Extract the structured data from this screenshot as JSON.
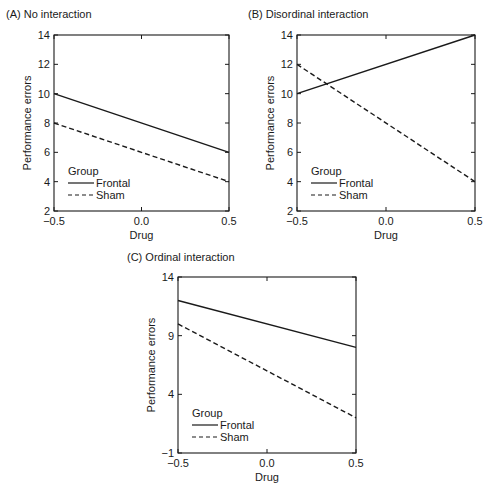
{
  "chart_data": [
    {
      "panel": "A",
      "type": "line",
      "title": "(A) No interaction",
      "xlabel": "Drug",
      "ylabel": "Performance errors",
      "x": [
        -0.5,
        0.5
      ],
      "xticks": [
        "-0.5",
        "0.0",
        "0.5"
      ],
      "xlim": [
        -0.5,
        0.5
      ],
      "yticks": [
        2,
        4,
        6,
        8,
        10,
        12,
        14
      ],
      "ylim": [
        2,
        14
      ],
      "legend_title": "Group",
      "legend_position": "lower left",
      "series": [
        {
          "name": "Frontal",
          "style": "solid",
          "values": [
            10,
            6
          ]
        },
        {
          "name": "Sham",
          "style": "dashed",
          "values": [
            8,
            4
          ]
        }
      ],
      "grid": false
    },
    {
      "panel": "B",
      "type": "line",
      "title": "(B) Disordinal interaction",
      "xlabel": "Drug",
      "ylabel": "Performance errors",
      "x": [
        -0.5,
        0.5
      ],
      "xticks": [
        "-0.5",
        "0.0",
        "0.5"
      ],
      "xlim": [
        -0.5,
        0.5
      ],
      "yticks": [
        2,
        4,
        6,
        8,
        10,
        12,
        14
      ],
      "ylim": [
        2,
        14
      ],
      "legend_title": "Group",
      "legend_position": "lower left",
      "series": [
        {
          "name": "Frontal",
          "style": "solid",
          "values": [
            10,
            14
          ]
        },
        {
          "name": "Sham",
          "style": "dashed",
          "values": [
            12,
            4
          ]
        }
      ],
      "grid": false
    },
    {
      "panel": "C",
      "type": "line",
      "title": "(C) Ordinal interaction",
      "xlabel": "Drug",
      "ylabel": "Performance errors",
      "x": [
        -0.5,
        0.5
      ],
      "xticks": [
        "-0.5",
        "0.0",
        "0.5"
      ],
      "xlim": [
        -0.5,
        0.5
      ],
      "yticks": [
        -1,
        4,
        9,
        14
      ],
      "ylim": [
        -1,
        14
      ],
      "legend_title": "Group",
      "legend_position": "lower left",
      "series": [
        {
          "name": "Frontal",
          "style": "solid",
          "values": [
            12,
            8
          ]
        },
        {
          "name": "Sham",
          "style": "dashed",
          "values": [
            10,
            2
          ]
        }
      ],
      "grid": false
    }
  ],
  "layout": {
    "panels": [
      {
        "frame": [
          54,
          35,
          229,
          211
        ],
        "title_pos": [
          6,
          8
        ]
      },
      {
        "frame": [
          297,
          35,
          475,
          211
        ],
        "title_pos": [
          248,
          8
        ]
      },
      {
        "frame": [
          178,
          277,
          356,
          453
        ],
        "title_pos": [
          127,
          251
        ]
      }
    ],
    "line_color": "#1a1a1a"
  },
  "caption": "FIGURE 1.1.1  Illustration of interaction effects"
}
